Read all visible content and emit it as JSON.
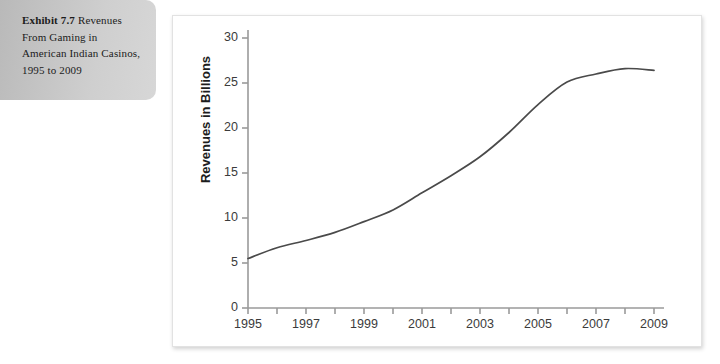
{
  "caption": {
    "lead": "Exhibit 7.7",
    "body": " Revenues From Gaming in American Indian Casinos, 1995 to 2009"
  },
  "chart_data": {
    "type": "line",
    "title": "",
    "xlabel": "",
    "ylabel": "Revenues in Billions",
    "xlim": [
      1995,
      2009
    ],
    "ylim": [
      0,
      30
    ],
    "grid": false,
    "legend": null,
    "line_color": "#4a4a4a",
    "axis_color": "#9a9a9a",
    "y_ticks": [
      0,
      5,
      10,
      15,
      20,
      25,
      30
    ],
    "y_tick_labels": [
      "0",
      "5",
      "10",
      "15",
      "20",
      "25",
      "30"
    ],
    "x_ticks": [
      1995,
      1996,
      1997,
      1998,
      1999,
      2000,
      2001,
      2002,
      2003,
      2004,
      2005,
      2006,
      2007,
      2008,
      2009
    ],
    "x_tick_labels": [
      "1995",
      "",
      "1997",
      "",
      "1999",
      "",
      "2001",
      "",
      "2003",
      "",
      "2005",
      "",
      "2007",
      "",
      "2009"
    ],
    "x_labeled_ticks": [
      "1995",
      "1997",
      "1999",
      "2001",
      "2003",
      "2005",
      "2007",
      "2009"
    ],
    "x": [
      1995,
      1996,
      1997,
      1998,
      1999,
      2000,
      2001,
      2002,
      2003,
      2004,
      2005,
      2006,
      2007,
      2008,
      2009
    ],
    "values": [
      5.5,
      6.7,
      7.5,
      8.4,
      9.6,
      10.9,
      12.8,
      14.7,
      16.8,
      19.5,
      22.6,
      25.1,
      26.0,
      26.6,
      26.4
    ],
    "series": [
      {
        "name": "Revenues in Billions",
        "values": [
          5.5,
          6.7,
          7.5,
          8.4,
          9.6,
          10.9,
          12.8,
          14.7,
          16.8,
          19.5,
          22.6,
          25.1,
          26.0,
          26.6,
          26.4
        ]
      }
    ]
  }
}
